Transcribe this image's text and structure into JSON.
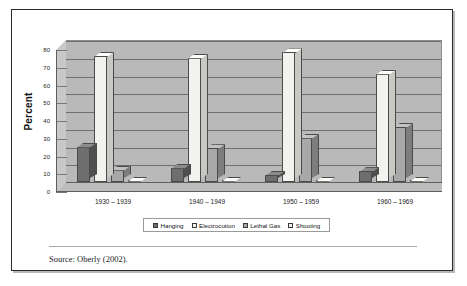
{
  "figure": {
    "source_note": "Source: Oberly (2002)."
  },
  "chart_data": {
    "type": "bar",
    "title": "",
    "subtitle": "",
    "xlabel": "",
    "ylabel": "Percent",
    "ylim": [
      0,
      80
    ],
    "ytick_labels": [
      "80",
      "70",
      "60",
      "50",
      "40",
      "30",
      "20",
      "10",
      "0"
    ],
    "yticks": [
      80,
      70,
      60,
      50,
      40,
      30,
      20,
      10,
      0
    ],
    "grid": true,
    "style": "3d-clustered-column",
    "legend_position": "bottom",
    "categories": [
      "1930 – 1939",
      "1940 – 1949",
      "1950 – 1959",
      "1960 – 1969"
    ],
    "series": [
      {
        "name": "Hanging",
        "color": "#6e6e6e",
        "side_color": "#4f4f4f",
        "top_color": "#8b8b8b",
        "values": [
          20,
          8,
          4,
          6
        ]
      },
      {
        "name": "Electrocution",
        "color": "#f2f2ee",
        "side_color": "#c9c9c4",
        "top_color": "#fdfdfb",
        "values": [
          71,
          70,
          73,
          61
        ]
      },
      {
        "name": "Lethal Gas",
        "color": "#a8a8a8",
        "side_color": "#7d7d7d",
        "top_color": "#c2c2c2",
        "values": [
          7,
          19,
          25,
          31
        ]
      },
      {
        "name": "Shooting",
        "color": "#efefeb",
        "side_color": "#c4c4bf",
        "top_color": "#fbfbf8",
        "values": [
          0.6,
          0.6,
          0.6,
          0.6
        ]
      }
    ]
  }
}
